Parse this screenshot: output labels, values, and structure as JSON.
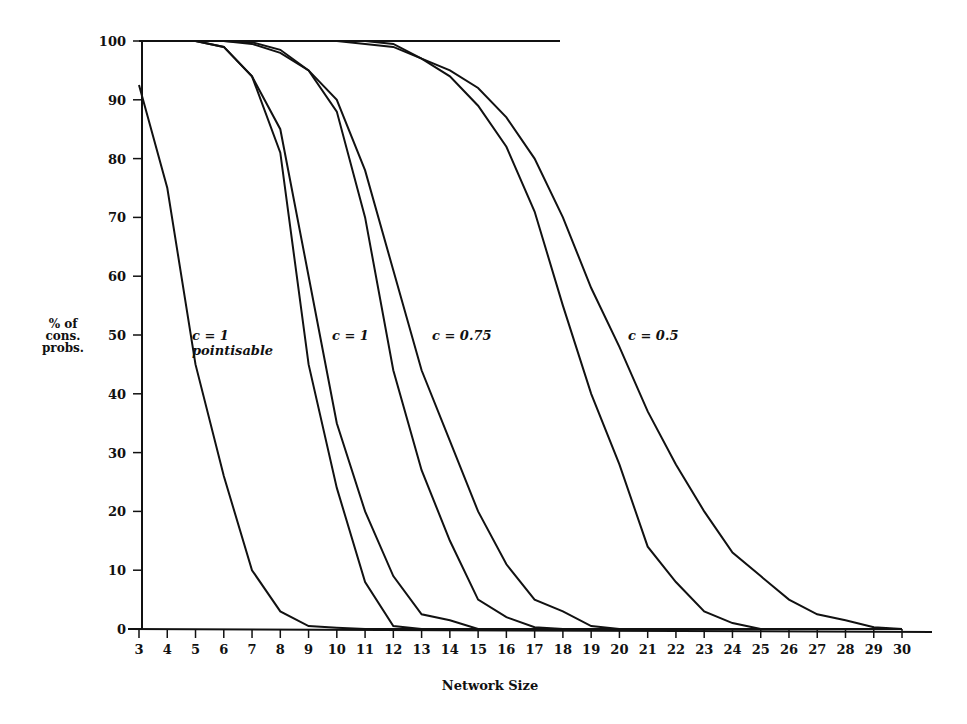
{
  "chart_data": {
    "type": "line",
    "title": "",
    "xlabel": "Network Size",
    "ylabel": "% of cons. probs.",
    "ylim": [
      0,
      100
    ],
    "xlim": [
      3,
      30
    ],
    "grid": false,
    "x": [
      3,
      4,
      5,
      6,
      7,
      8,
      9,
      10,
      11,
      12,
      13,
      14,
      15,
      16,
      17,
      18,
      19,
      20,
      21,
      22,
      23,
      24,
      25,
      26,
      27,
      28,
      29,
      30
    ],
    "y_ticks": [
      0,
      10,
      20,
      30,
      40,
      50,
      60,
      70,
      80,
      90,
      100
    ],
    "series": [
      {
        "name": "c = 1 pointisable",
        "values": [
          92.5,
          75,
          45,
          26,
          10,
          3,
          0.5,
          0.2,
          0,
          0,
          0,
          0,
          0,
          0,
          0,
          0,
          0,
          0,
          0,
          0,
          0,
          0,
          0,
          0,
          0,
          0,
          0,
          0
        ]
      },
      {
        "name": "c = 1 (a)",
        "values": [
          100,
          100,
          100,
          99,
          94,
          81,
          45,
          24,
          8,
          0.5,
          0,
          0,
          0,
          0,
          0,
          0,
          0,
          0,
          0,
          0,
          0,
          0,
          0,
          0,
          0,
          0,
          0,
          0
        ]
      },
      {
        "name": "c = 1 (b)",
        "values": [
          100,
          100,
          100,
          99,
          94,
          85,
          60,
          35,
          20,
          9,
          2.5,
          1.5,
          0,
          0,
          0,
          0,
          0,
          0,
          0,
          0,
          0,
          0,
          0,
          0,
          0,
          0,
          0,
          0
        ]
      },
      {
        "name": "c = 0.75 (a)",
        "values": [
          100,
          100,
          100,
          100,
          99.5,
          98,
          95,
          88,
          70,
          44,
          27,
          15,
          5,
          2,
          0.3,
          0,
          0,
          0,
          0,
          0,
          0,
          0,
          0,
          0,
          0,
          0,
          0,
          0
        ]
      },
      {
        "name": "c = 0.75 (b)",
        "values": [
          100,
          100,
          100,
          100,
          99.8,
          98.5,
          95,
          90,
          78,
          61,
          44,
          32,
          20,
          11,
          5,
          3,
          0.5,
          0,
          0,
          0,
          0,
          0,
          0,
          0,
          0,
          0,
          0,
          0
        ]
      },
      {
        "name": "c = 0.5 (a)",
        "values": [
          100,
          100,
          100,
          100,
          100,
          100,
          100,
          100,
          99.5,
          99,
          97,
          94,
          89,
          82,
          71,
          55,
          40,
          28,
          14,
          8,
          3,
          1,
          0,
          0,
          0,
          0,
          0,
          0
        ]
      },
      {
        "name": "c = 0.5 (b)",
        "values": [
          100,
          100,
          100,
          100,
          100,
          100,
          100,
          100,
          100,
          99.5,
          97,
          95,
          92,
          87,
          80,
          70,
          58,
          48,
          37,
          28,
          20,
          13,
          9,
          5,
          2.5,
          1.5,
          0.3,
          0
        ]
      }
    ],
    "annotations": [
      {
        "text": "c = 1",
        "sub": "pointisable",
        "x": 5.8,
        "y": 50
      },
      {
        "text": "c = 1",
        "x": 9.6,
        "y": 50
      },
      {
        "text": "c = 0.75",
        "x": 13.5,
        "y": 50
      },
      {
        "text": "c = 0.5",
        "x": 21.2,
        "y": 50
      }
    ]
  },
  "labels": {
    "ylabel_lines": [
      "% of",
      "cons.",
      "probs."
    ],
    "xlabel": "Network Size",
    "ann0": "c = 1",
    "ann0_sub": "pointisable",
    "ann1": "c = 1",
    "ann2": "c = 0.75",
    "ann3": "c = 0.5"
  }
}
